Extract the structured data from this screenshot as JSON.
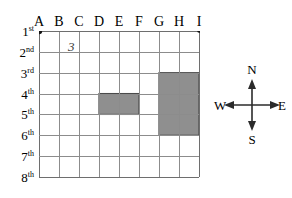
{
  "diagram": {
    "grid": {
      "column_labels": [
        "A",
        "B",
        "C",
        "D",
        "E",
        "F",
        "G",
        "H",
        "I"
      ],
      "row_labels": [
        {
          "number": "1",
          "ordinal": "st"
        },
        {
          "number": "2",
          "ordinal": "nd"
        },
        {
          "number": "3",
          "ordinal": "rd"
        },
        {
          "number": "4",
          "ordinal": "th"
        },
        {
          "number": "5",
          "ordinal": "th"
        },
        {
          "number": "6",
          "ordinal": "th"
        },
        {
          "number": "7",
          "ordinal": "th"
        },
        {
          "number": "8",
          "ordinal": "th"
        }
      ],
      "columns": 8,
      "rows": 7,
      "line_color": "#8c8c8c",
      "border_color": "#6e6e6e"
    },
    "corner_dots": [
      {
        "name": "origin-dot",
        "column": "A",
        "row": "1st",
        "col_index": 0,
        "row_index": 0,
        "radius": 3.2
      },
      {
        "name": "end-dot",
        "column": "I",
        "row": "1st",
        "col_index": 8,
        "row_index": 0,
        "radius": 1.8
      }
    ],
    "blocks": [
      {
        "name": "small-block",
        "fill": "#8f8f8f",
        "col_start": 3,
        "col_end": 5,
        "row_start": 3,
        "row_end": 4,
        "span_columns": "D to F",
        "span_rows": "4th to 5th"
      },
      {
        "name": "large-block",
        "fill": "#8f8f8f",
        "col_start": 6,
        "col_end": 8,
        "row_start": 2,
        "row_end": 5,
        "span_columns": "G to I",
        "span_rows": "3rd to 6th"
      }
    ],
    "annotations": [
      {
        "name": "annotation-three",
        "text": "3",
        "x": 68,
        "y": 40
      }
    ]
  },
  "compass": {
    "north": "N",
    "south": "S",
    "east": "E",
    "west": "W",
    "arrow_color": "#2b2b2b"
  }
}
